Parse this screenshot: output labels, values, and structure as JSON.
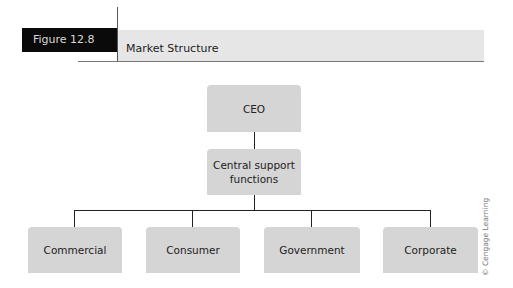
{
  "header": {
    "figure_label": "Figure 12.8",
    "title": "Market Structure"
  },
  "org_chart": {
    "root": {
      "label": "CEO"
    },
    "support": {
      "label": "Central support functions",
      "line1": "Central support",
      "line2": "functions"
    },
    "divisions": [
      {
        "label": "Commercial"
      },
      {
        "label": "Consumer"
      },
      {
        "label": "Government"
      },
      {
        "label": "Corporate"
      }
    ]
  },
  "credit": "© Cengage Learning",
  "colors": {
    "box_fill": "#d5d5d5",
    "figure_label_bg": "#0a0a0a",
    "title_band_bg": "#e6e6e6",
    "connector": "#222222"
  }
}
